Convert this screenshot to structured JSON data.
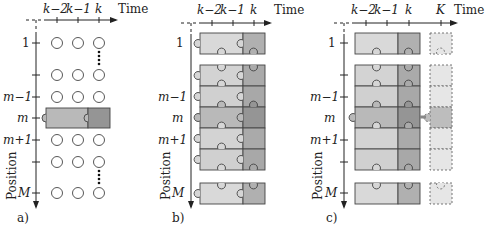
{
  "figure": {
    "colors": {
      "light_block": "#d9d9d9",
      "dark_block": "#a8a8a8",
      "highlight_light": "#b9b9b9",
      "highlight_dark": "#8f8f8f",
      "future_block": "#e6e6e6",
      "stroke": "#444444",
      "axis": "#222222"
    },
    "time_axis_label": "Time",
    "position_axis_label": "Position",
    "time_ticks": [
      "k−2",
      "k−1",
      "k"
    ],
    "future_tick": "K",
    "position_ticks": [
      "1",
      "",
      "m−1",
      "m",
      "m+1",
      "",
      "M"
    ],
    "panels": [
      {
        "id": "a",
        "caption": "a)",
        "description": "Circles per position/time; only row m shown as puzzle block"
      },
      {
        "id": "b",
        "caption": "b)",
        "description": "All positions as interlocking puzzle blocks"
      },
      {
        "id": "c",
        "caption": "c)",
        "description": "Puzzle blocks with dashed future column up to time K"
      }
    ]
  }
}
